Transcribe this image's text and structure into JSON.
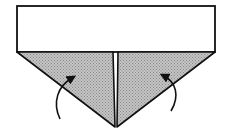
{
  "diagram": {
    "type": "origami-fold-step",
    "rectangle": {
      "fill": "#ffffff",
      "stroke": "#111111"
    },
    "flaps": [
      {
        "side": "left",
        "fill": "#b5b5b5",
        "pattern": "dotted-halftone"
      },
      {
        "side": "right",
        "fill": "#b5b5b5",
        "pattern": "dotted-halftone"
      }
    ],
    "arrows": [
      {
        "side": "left",
        "direction": "fold-up"
      },
      {
        "side": "right",
        "direction": "fold-up"
      }
    ],
    "colors": {
      "stroke": "#111111",
      "shade": "#b5b5b5",
      "background": "#ffffff"
    }
  }
}
